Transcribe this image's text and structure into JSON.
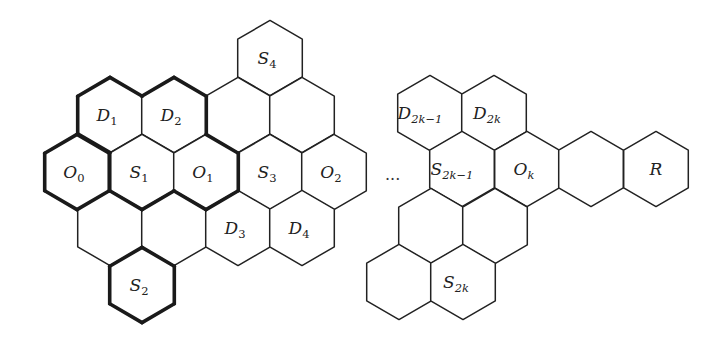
{
  "figure": {
    "ellipsis": "···",
    "hex_geometry": {
      "half_width": 32.3,
      "side": 37.6
    },
    "colors": {
      "stroke": "#222222",
      "fill": "#ffffff",
      "thick_stroke": "#1a1a1a"
    },
    "left_cluster": {
      "cells": [
        {
          "id": "S4",
          "base": "S",
          "sub": "4",
          "cx": 270,
          "cy": 58
        },
        {
          "id": "D1",
          "base": "D",
          "sub": "1",
          "cx": 110,
          "cy": 115
        },
        {
          "id": "D2",
          "base": "D",
          "sub": "2",
          "cx": 174,
          "cy": 115
        },
        {
          "id": "empty-a",
          "base": "",
          "sub": "",
          "cx": 238,
          "cy": 115
        },
        {
          "id": "empty-b",
          "base": "",
          "sub": "",
          "cx": 302,
          "cy": 115
        },
        {
          "id": "O0",
          "base": "O",
          "sub": "0",
          "cx": 77,
          "cy": 172
        },
        {
          "id": "S1",
          "base": "S",
          "sub": "1",
          "cx": 142,
          "cy": 172
        },
        {
          "id": "O1",
          "base": "O",
          "sub": "1",
          "cx": 206,
          "cy": 172
        },
        {
          "id": "S3",
          "base": "S",
          "sub": "3",
          "cx": 270,
          "cy": 172
        },
        {
          "id": "O2",
          "base": "O",
          "sub": "2",
          "cx": 334,
          "cy": 172
        },
        {
          "id": "empty-c",
          "base": "",
          "sub": "",
          "cx": 110,
          "cy": 228
        },
        {
          "id": "empty-d",
          "base": "",
          "sub": "",
          "cx": 174,
          "cy": 228
        },
        {
          "id": "D3",
          "base": "D",
          "sub": "3",
          "cx": 238,
          "cy": 228
        },
        {
          "id": "D4",
          "base": "D",
          "sub": "4",
          "cx": 302,
          "cy": 228
        },
        {
          "id": "S2",
          "base": "S",
          "sub": "2",
          "cx": 142,
          "cy": 285
        }
      ]
    },
    "right_cluster": {
      "cells": [
        {
          "id": "D2k-1",
          "base": "D",
          "sub": "2k−1",
          "cx": 430,
          "cy": 113
        },
        {
          "id": "D2k",
          "base": "D",
          "sub": "2k",
          "cx": 494,
          "cy": 113
        },
        {
          "id": "S2k-1",
          "base": "S",
          "sub": "2k−1",
          "cx": 462,
          "cy": 169
        },
        {
          "id": "Ok",
          "base": "O",
          "sub": "k",
          "cx": 527,
          "cy": 169
        },
        {
          "id": "empty-e",
          "base": "",
          "sub": "",
          "cx": 591,
          "cy": 169
        },
        {
          "id": "R",
          "base": "R",
          "sub": "",
          "cx": 656,
          "cy": 169
        },
        {
          "id": "empty-f",
          "base": "",
          "sub": "",
          "cx": 431,
          "cy": 226
        },
        {
          "id": "empty-g",
          "base": "",
          "sub": "",
          "cx": 495,
          "cy": 226
        },
        {
          "id": "empty-h",
          "base": "",
          "sub": "",
          "cx": 399,
          "cy": 282
        },
        {
          "id": "S2k",
          "base": "S",
          "sub": "2k",
          "cx": 463,
          "cy": 282
        }
      ]
    },
    "highlighted_regions": [
      {
        "name": "D1-D2-O0-S1-O1 region",
        "cells": [
          "D1",
          "D2",
          "O0",
          "S1",
          "O1"
        ]
      },
      {
        "name": "S2 cell",
        "cells": [
          "S2"
        ]
      }
    ]
  }
}
